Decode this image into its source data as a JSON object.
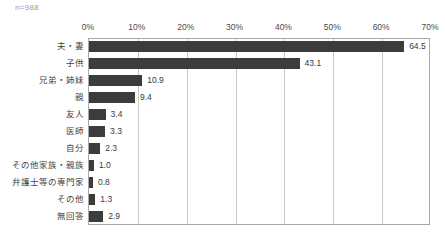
{
  "sample_size_note": "n=988",
  "chart_data": {
    "type": "bar",
    "orientation": "horizontal",
    "title": "",
    "subtitle": "",
    "xlabel": "",
    "ylabel": "",
    "xlim": [
      0,
      70
    ],
    "grid": true,
    "legend": null,
    "axis_label_position": "top",
    "bar_color": "#3c3c3c",
    "gridline_color": "#c9c9c9",
    "plot_border_color": "#a8a8a8",
    "value_label_color": "#3a3a3a",
    "tick_labels": [
      "0%",
      "10%",
      "20%",
      "30%",
      "40%",
      "50%",
      "60%",
      "70%"
    ],
    "tick_values": [
      0,
      10,
      20,
      30,
      40,
      50,
      60,
      70
    ],
    "categories": [
      "夫・妻",
      "子供",
      "兄弟・姉妹",
      "親",
      "友人",
      "医師",
      "自分",
      "その他家族・親族",
      "弁護士等の専門家",
      "その他",
      "無回答"
    ],
    "values": [
      64.5,
      43.1,
      10.9,
      9.4,
      3.4,
      3.3,
      2.3,
      1.0,
      0.8,
      1.3,
      2.9
    ],
    "value_labels": [
      "64.5",
      "43.1",
      "10.9",
      "9.4",
      "3.4",
      "3.3",
      "2.3",
      "1.0",
      "0.8",
      "1.3",
      "2.9"
    ]
  }
}
